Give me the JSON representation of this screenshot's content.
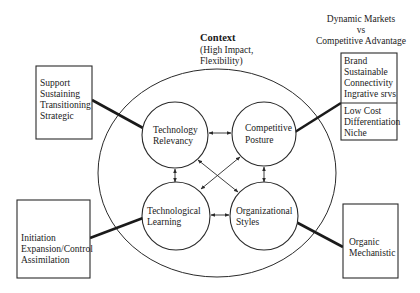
{
  "context": {
    "title": "Context",
    "subtitle_line1": "(High Impact,",
    "subtitle_line2": "Flexibility)"
  },
  "header_right": {
    "line1": "Dynamic Markets",
    "line2": "vs",
    "line3": "Competitive Advantage"
  },
  "nodes": [
    {
      "id": "technology-relevancy",
      "line1": "Technology",
      "line2": "Relevancy"
    },
    {
      "id": "competitive-posture",
      "line1": "Competitive",
      "line2": "Posture"
    },
    {
      "id": "technological-learning",
      "line1": "Technological",
      "line2": "Learning"
    },
    {
      "id": "organizational-styles",
      "line1": "Organizational",
      "line2": "Styles"
    }
  ],
  "boxes": {
    "top_left": {
      "items": [
        "Support",
        "Sustaining",
        "Transitioning",
        "Strategic"
      ]
    },
    "top_right": {
      "upper_items": [
        "Brand",
        "Sustainable",
        "Connectivity",
        "Ingrative srvs"
      ],
      "lower_items": [
        "Low Cost",
        "Differentiation",
        "Niche"
      ]
    },
    "bottom_left": {
      "items": [
        "Initiation",
        "Expansion/Control",
        "Assimilation"
      ]
    },
    "bottom_right": {
      "items": [
        "Organic",
        "Mechanistic"
      ]
    }
  },
  "connections": [
    {
      "from": "technology-relevancy",
      "to": "competitive-posture",
      "type": "bidirectional"
    },
    {
      "from": "technology-relevancy",
      "to": "technological-learning",
      "type": "bidirectional"
    },
    {
      "from": "competitive-posture",
      "to": "organizational-styles",
      "type": "bidirectional"
    },
    {
      "from": "technological-learning",
      "to": "organizational-styles",
      "type": "bidirectional"
    },
    {
      "from": "technology-relevancy",
      "to": "organizational-styles",
      "type": "bidirectional"
    },
    {
      "from": "competitive-posture",
      "to": "technological-learning",
      "type": "bidirectional"
    }
  ]
}
